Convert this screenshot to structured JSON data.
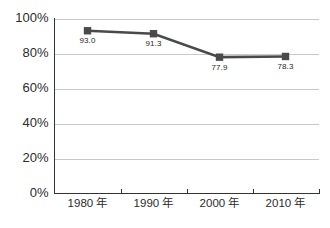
{
  "chart_data": {
    "type": "line",
    "title": "",
    "subtitle": "",
    "xlabel": "",
    "ylabel": "",
    "categories": [
      "1980 年",
      "1990 年",
      "2000 年",
      "2010 年"
    ],
    "values": [
      93.0,
      91.3,
      77.9,
      78.3
    ],
    "point_labels": [
      "93.0",
      "91.3",
      "77.9",
      "78.3"
    ],
    "series": [
      {
        "name": "",
        "values": [
          93.0,
          91.3,
          77.9,
          78.3
        ]
      }
    ],
    "ylim": [
      0,
      100
    ],
    "ytick_values": [
      0,
      20,
      40,
      60,
      80,
      100
    ],
    "ytick_labels": [
      "0%",
      "20%",
      "40%",
      "60%",
      "80%",
      "100%"
    ],
    "xtick_labels": [
      "1980 年",
      "1990 年",
      "2000 年",
      "2010 年"
    ],
    "grid": "horizontal",
    "legend": "none",
    "legend_entries": [],
    "annotations": [],
    "marker": "square",
    "colors": {
      "series": "#4a4a4a",
      "marker": "#4a4a4a",
      "gridline": "#c9c9c9",
      "axis": "#333333",
      "text": "#2b2b2b",
      "background": "#ffffff"
    }
  }
}
